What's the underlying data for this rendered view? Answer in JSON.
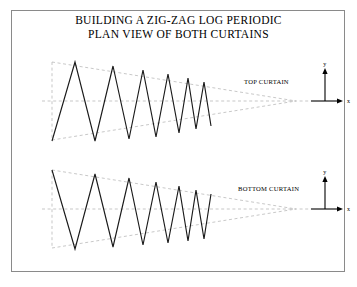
{
  "figure": {
    "title_line1": "BUILDING A ZIG-ZAG LOG PERIODIC",
    "title_line2": "PLAN VIEW OF BOTH CURTAINS",
    "frame_color": "#8a8a8a",
    "background": "#ffffff",
    "trace_color": "#1a1a1a",
    "envelope_color": "#b0b0b0",
    "axis_color": "#000000"
  },
  "panels": [
    {
      "id": "top-curtain",
      "label": "TOP CURTAIN",
      "label_x": 244,
      "label_y": 84,
      "apex_x": 296,
      "apex_y": 101,
      "centerline_y": 101,
      "start_x": 52,
      "top_envelope_y": 62,
      "bottom_envelope_y": 140,
      "start_phase": "trough",
      "peak_count": 6,
      "axis": {
        "origin_x": 311,
        "origin_y": 101,
        "x_arrow_x": 343,
        "y_arrow_y": 68,
        "x_label": "x",
        "y_label": "y"
      },
      "vertices_x": [
        52,
        75,
        95,
        113,
        129,
        143,
        156,
        168,
        179,
        188,
        196,
        204,
        211
      ],
      "vertices_y": [
        141,
        62,
        141,
        66,
        139,
        70,
        137,
        74,
        133,
        78,
        129,
        82,
        126
      ]
    },
    {
      "id": "bottom-curtain",
      "label": "BOTTOM CURTAIN",
      "label_x": 238,
      "label_y": 191,
      "apex_x": 296,
      "apex_y": 209,
      "centerline_y": 209,
      "start_x": 52,
      "top_envelope_y": 170,
      "bottom_envelope_y": 248,
      "start_phase": "peak",
      "peak_count": 6,
      "axis": {
        "origin_x": 311,
        "origin_y": 209,
        "x_arrow_x": 343,
        "y_arrow_y": 176,
        "x_label": "x",
        "y_label": "y"
      },
      "vertices_x": [
        52,
        75,
        95,
        113,
        129,
        143,
        156,
        168,
        179,
        188,
        196,
        204,
        211
      ],
      "vertices_y": [
        170,
        249,
        174,
        247,
        178,
        245,
        182,
        243,
        186,
        241,
        190,
        239,
        194
      ]
    }
  ]
}
